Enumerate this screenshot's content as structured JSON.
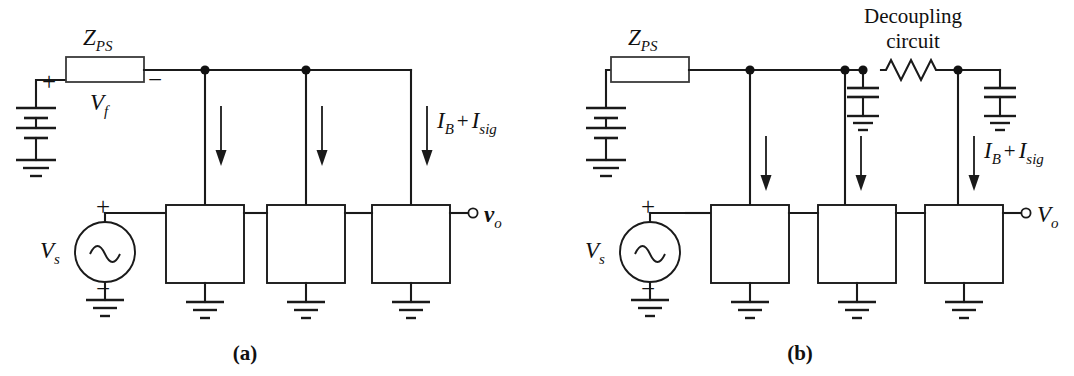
{
  "figure": {
    "background_color": "#ffffff",
    "line_color": "#1a1a1a",
    "impedance_fill_color": "#d8d8d8"
  },
  "panel_a": {
    "caption": "(a)",
    "impedance_label": "Z",
    "impedance_sub": "PS",
    "feedback_voltage_label": "V",
    "feedback_voltage_sub": "f",
    "plus_sign": "+",
    "minus_sign": "−",
    "source_label": "V",
    "source_sub": "s",
    "source_plus": "+",
    "source_minus": "−",
    "output_label": "v",
    "output_sub": "o",
    "current_label_1": "I",
    "current_sub_1": "B",
    "current_plus": "+",
    "current_label_2": "I",
    "current_sub_2": "sig",
    "stage_count": 3,
    "icons": {
      "battery": "battery-icon",
      "ground": "ground-icon",
      "ac_source": "ac-source-icon",
      "impedance_block": "impedance-block-icon",
      "current_arrow": "down-arrow-icon",
      "junction": "junction-dot-icon",
      "output_terminal": "open-terminal-icon"
    }
  },
  "panel_b": {
    "caption": "(b)",
    "impedance_label": "Z",
    "impedance_sub": "PS",
    "decoupling_line1": "Decoupling",
    "decoupling_line2": "circuit",
    "source_label": "V",
    "source_sub": "s",
    "source_plus": "+",
    "source_minus": "−",
    "output_label": "V",
    "output_sub": "o",
    "current_label_1": "I",
    "current_sub_1": "B",
    "current_plus": "+",
    "current_label_2": "I",
    "current_sub_2": "sig",
    "stage_count": 3,
    "icons": {
      "battery": "battery-icon",
      "ground": "ground-icon",
      "ac_source": "ac-source-icon",
      "impedance_block": "impedance-block-icon",
      "resistor": "resistor-icon",
      "capacitor": "capacitor-icon",
      "current_arrow": "down-arrow-icon",
      "junction": "junction-dot-icon",
      "output_terminal": "open-terminal-icon"
    }
  }
}
